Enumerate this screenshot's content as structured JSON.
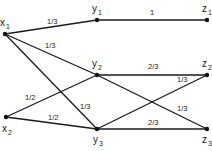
{
  "diagram": {
    "type": "bipartite-transition-graph",
    "nodes": [
      {
        "id": "x1",
        "base": "x",
        "sub": "1",
        "x": 5,
        "y": 34,
        "lx": 0,
        "ly": 26
      },
      {
        "id": "x2",
        "base": "x",
        "sub": "2",
        "x": 6,
        "y": 117,
        "lx": 2,
        "ly": 132
      },
      {
        "id": "y1",
        "base": "y",
        "sub": "1",
        "x": 97,
        "y": 20,
        "lx": 92,
        "ly": 12
      },
      {
        "id": "y2",
        "base": "y",
        "sub": "2",
        "x": 97,
        "y": 75,
        "lx": 92,
        "ly": 67
      },
      {
        "id": "y3",
        "base": "y",
        "sub": "3",
        "x": 97,
        "y": 129,
        "lx": 93,
        "ly": 143
      },
      {
        "id": "z1",
        "base": "z",
        "sub": "1",
        "x": 207,
        "y": 20,
        "lx": 202,
        "ly": 12
      },
      {
        "id": "z2",
        "base": "z",
        "sub": "2",
        "x": 207,
        "y": 75,
        "lx": 202,
        "ly": 67
      },
      {
        "id": "z3",
        "base": "z",
        "sub": "3",
        "x": 207,
        "y": 129,
        "lx": 202,
        "ly": 143
      }
    ],
    "edges": [
      {
        "from": "x1",
        "to": "y1",
        "label": "1/3",
        "lx": 47,
        "ly": 24
      },
      {
        "from": "x1",
        "to": "y2",
        "label": "1/3",
        "lx": 45,
        "ly": 48
      },
      {
        "from": "x1",
        "to": "y3",
        "label": "1/3",
        "lx": 80,
        "ly": 109
      },
      {
        "from": "x2",
        "to": "y2",
        "label": "1/2",
        "lx": 25,
        "ly": 100
      },
      {
        "from": "x2",
        "to": "y3",
        "label": "1/2",
        "lx": 48,
        "ly": 120
      },
      {
        "from": "y1",
        "to": "z1",
        "label": "1",
        "lx": 150,
        "ly": 15
      },
      {
        "from": "y2",
        "to": "z2",
        "label": "2/3",
        "lx": 148,
        "ly": 69
      },
      {
        "from": "y2",
        "to": "z3",
        "label": "1/3",
        "lx": 177,
        "ly": 111
      },
      {
        "from": "y3",
        "to": "z2",
        "label": "1/3",
        "lx": 177,
        "ly": 82
      },
      {
        "from": "y3",
        "to": "z3",
        "label": "2/3",
        "lx": 148,
        "ly": 125
      }
    ]
  }
}
